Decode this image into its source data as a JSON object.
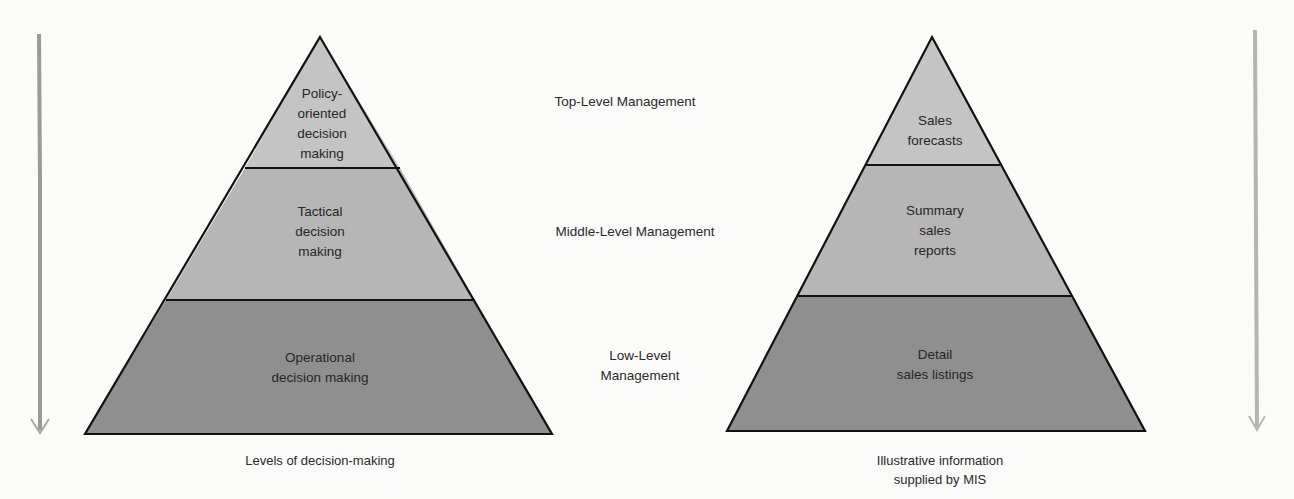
{
  "diagram": {
    "left_pyramid": {
      "caption": "Levels of decision-making",
      "segments": [
        {
          "label": "Policy-\noriented\ndecision\nmaking",
          "tier": "top",
          "fill": "#c4c4c4"
        },
        {
          "label": "Tactical\ndecision\nmaking",
          "tier": "middle",
          "fill": "#b6b6b6"
        },
        {
          "label": "Operational\ndecision making",
          "tier": "low",
          "fill": "#8f8f8f"
        }
      ]
    },
    "right_pyramid": {
      "caption": "Illustrative information\nsupplied by MIS",
      "segments": [
        {
          "label": "Sales\nforecasts",
          "tier": "top",
          "fill": "#c4c4c4"
        },
        {
          "label": "Summary\nsales\nreports",
          "tier": "middle",
          "fill": "#b6b6b6"
        },
        {
          "label": "Detail\nsales listings",
          "tier": "low",
          "fill": "#8f8f8f"
        }
      ]
    },
    "management_levels": [
      {
        "label": "Top-Level Management"
      },
      {
        "label": "Middle-Level Management"
      },
      {
        "label": "Low-Level\nManagement"
      }
    ],
    "arrows": {
      "left": {
        "direction": "down",
        "color": "#9a9a9a"
      },
      "right": {
        "direction": "down",
        "color": "#b4b4b4"
      }
    },
    "colors": {
      "outline": "#111111",
      "background": "#fbfbfa"
    }
  }
}
